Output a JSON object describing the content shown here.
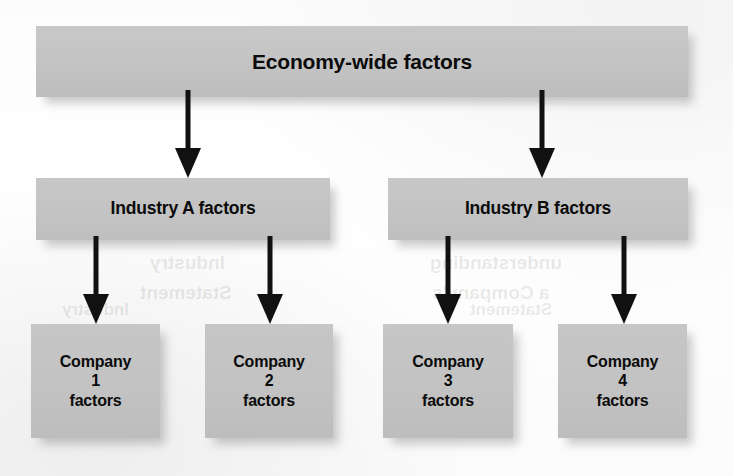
{
  "diagram": {
    "type": "hierarchy-tree",
    "title": "Economy-wide factors",
    "colors": {
      "box_fill": "#c3c3c3",
      "text": "#0b0b0b",
      "arrow": "#111111",
      "page_background": "#ffffff"
    },
    "levels": [
      {
        "name": "economy",
        "nodes": [
          {
            "id": "economy-wide",
            "label": "Economy-wide factors"
          }
        ]
      },
      {
        "name": "industry",
        "nodes": [
          {
            "id": "industry-a",
            "label": "Industry A factors"
          },
          {
            "id": "industry-b",
            "label": "Industry B factors"
          }
        ]
      },
      {
        "name": "company",
        "nodes": [
          {
            "id": "company-1",
            "label": "Company\n1\nfactors"
          },
          {
            "id": "company-2",
            "label": "Company\n2\nfactors"
          },
          {
            "id": "company-3",
            "label": "Company\n3\nfactors"
          },
          {
            "id": "company-4",
            "label": "Company\n4\nfactors"
          }
        ]
      }
    ],
    "connectors": [
      {
        "id": "economy-to-industry-a",
        "from": "economy-wide",
        "to": "industry-a"
      },
      {
        "id": "economy-to-industry-b",
        "from": "economy-wide",
        "to": "industry-b"
      },
      {
        "id": "industry-a-to-company-1",
        "from": "industry-a",
        "to": "company-1"
      },
      {
        "id": "industry-a-to-company-2",
        "from": "industry-a",
        "to": "company-2"
      },
      {
        "id": "industry-b-to-company-3",
        "from": "industry-b",
        "to": "company-3"
      },
      {
        "id": "industry-b-to-company-4",
        "from": "industry-b",
        "to": "company-4"
      }
    ],
    "bleed_through": [
      {
        "id": "bleed-industry",
        "text": "Industry"
      },
      {
        "id": "bleed-statement",
        "text": "Statement"
      },
      {
        "id": "bleed-understanding",
        "text": "understanding"
      },
      {
        "id": "bleed-a-company",
        "text": "a Company's"
      }
    ]
  }
}
